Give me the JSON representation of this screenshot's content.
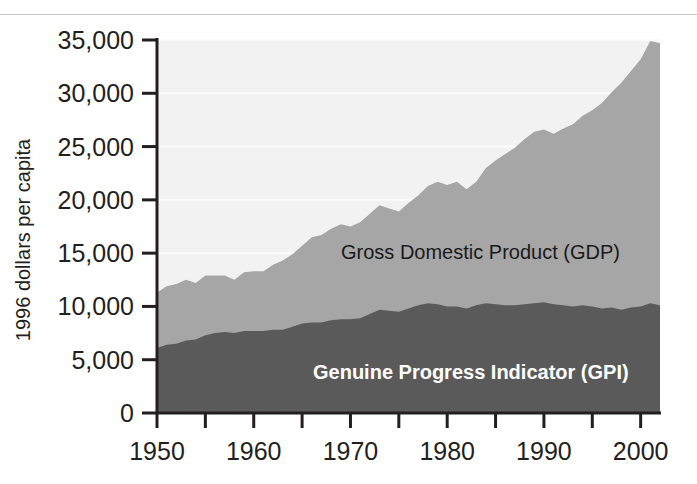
{
  "chart_data": {
    "type": "area",
    "stacked": false,
    "title": "",
    "xlabel": "",
    "ylabel": "1996 dollars per capita",
    "xlim": [
      1950,
      2002
    ],
    "ylim": [
      0,
      35000
    ],
    "grid": true,
    "grid_orientation": "horizontal",
    "legend_position": "inline-annotation",
    "x_ticks_major": [
      1950,
      1960,
      1970,
      1980,
      1990,
      2000
    ],
    "x_ticks_minor": [
      1955,
      1965,
      1975,
      1985,
      1995
    ],
    "x_tick_labels": [
      "1950",
      "1960",
      "1970",
      "1980",
      "1990",
      "2000"
    ],
    "y_ticks": [
      0,
      5000,
      10000,
      15000,
      20000,
      25000,
      30000,
      35000
    ],
    "y_tick_labels": [
      "0",
      "5,000",
      "10,000",
      "15,000",
      "20,000",
      "25,000",
      "30,000",
      "35,000"
    ],
    "x": [
      1950,
      1951,
      1952,
      1953,
      1954,
      1955,
      1956,
      1957,
      1958,
      1959,
      1960,
      1961,
      1962,
      1963,
      1964,
      1965,
      1966,
      1967,
      1968,
      1969,
      1970,
      1971,
      1972,
      1973,
      1974,
      1975,
      1976,
      1977,
      1978,
      1979,
      1980,
      1981,
      1982,
      1983,
      1984,
      1985,
      1986,
      1987,
      1988,
      1989,
      1990,
      1991,
      1992,
      1993,
      1994,
      1995,
      1996,
      1997,
      1998,
      1999,
      2000,
      2001,
      2002
    ],
    "series": [
      {
        "name": "Gross Domestic Product (GDP)",
        "label": "Gross Domestic Product (GDP)",
        "color": "#a6a6a6",
        "values": [
          11300,
          11900,
          12100,
          12500,
          12200,
          12900,
          12900,
          12900,
          12500,
          13200,
          13300,
          13300,
          13900,
          14300,
          14900,
          15700,
          16500,
          16700,
          17300,
          17700,
          17500,
          17900,
          18700,
          19500,
          19200,
          18900,
          19700,
          20400,
          21300,
          21700,
          21400,
          21700,
          21000,
          21700,
          23000,
          23700,
          24300,
          24900,
          25700,
          26400,
          26600,
          26200,
          26700,
          27100,
          27900,
          28400,
          29100,
          30100,
          31000,
          32100,
          33200,
          34900,
          34700
        ]
      },
      {
        "name": "Genuine Progress Indicator (GPI)",
        "label": "Genuine Progress Indicator (GPI)",
        "color": "#5a5a5a",
        "values": [
          6100,
          6400,
          6500,
          6800,
          6900,
          7300,
          7500,
          7600,
          7500,
          7700,
          7700,
          7700,
          7800,
          7800,
          8100,
          8400,
          8500,
          8500,
          8700,
          8800,
          8800,
          8900,
          9300,
          9700,
          9600,
          9500,
          9800,
          10100,
          10300,
          10200,
          10000,
          10000,
          9800,
          10100,
          10300,
          10200,
          10100,
          10100,
          10200,
          10300,
          10400,
          10200,
          10100,
          10000,
          10100,
          10000,
          9800,
          9900,
          9700,
          9900,
          10000,
          10300,
          10100
        ]
      }
    ],
    "annotations": [
      {
        "text": "Gross Domestic Product (GDP)",
        "x": 1977,
        "y": 15800,
        "style": "dark"
      },
      {
        "text": "Genuine Progress Indicator (GPI)",
        "x": 1982,
        "y": 4600,
        "style": "light-bold"
      }
    ],
    "colors": {
      "background_above": "#f2f2f2",
      "gdp_band": "#a6a6a6",
      "gpi_band": "#5a5a5a",
      "axis": "#231f20",
      "gridline": "#fbfbfb",
      "text": "#231f20",
      "top_rule": "#c8c8c8"
    }
  }
}
